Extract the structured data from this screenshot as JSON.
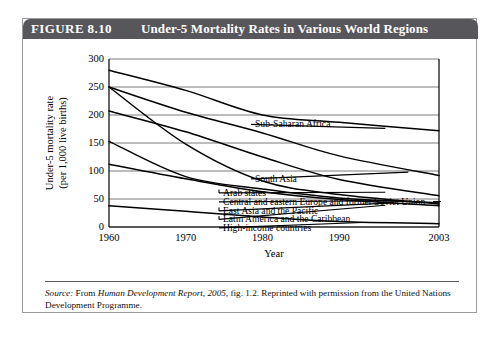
{
  "figure": {
    "number_label": "FIGURE 8.10",
    "title": "Under-5 Mortality Rates in Various World Regions"
  },
  "source_note": {
    "label": "Source:",
    "text_1": " From ",
    "publication": "Human Development Report, 2005,",
    "text_2": " fig. 1.2. Reprinted with permission from the United Nations Development Programme."
  },
  "chart_data": {
    "type": "line",
    "title": "",
    "xlabel": "Year",
    "ylabel": "Under-5 mortality rate\n(per 1,000 live births)",
    "ylabel_line1": "Under-5 mortality rate",
    "ylabel_line2": "(per 1,000 live births)",
    "x": [
      1960,
      1970,
      1980,
      1990,
      2003
    ],
    "xticks": [
      "1960",
      "1970",
      "1980",
      "1990",
      "2003"
    ],
    "yticks": [
      "0",
      "50",
      "100",
      "150",
      "200",
      "250",
      "300"
    ],
    "ylim": [
      0,
      300
    ],
    "xlim": [
      1960,
      2003
    ],
    "grid": "horizontal",
    "legend": "inline-leader-labels",
    "series": [
      {
        "name": "Sub-Saharan Africa",
        "values": [
          280,
          244,
          200,
          187,
          172
        ]
      },
      {
        "name": "South Asia",
        "values": [
          250,
          205,
          168,
          127,
          92
        ]
      },
      {
        "name": "Arab states",
        "values": [
          207,
          170,
          125,
          85,
          56
        ]
      },
      {
        "name": "Central and eastern Europe and former Soviet Union",
        "values": [
          153,
          90,
          68,
          52,
          43
        ]
      },
      {
        "name": "East Asia and the Pacific",
        "values": [
          250,
          148,
          82,
          58,
          41
        ]
      },
      {
        "name": "Latin America and the Caribbean",
        "values": [
          112,
          86,
          63,
          49,
          38
        ]
      },
      {
        "name": "High-income countries",
        "values": [
          38,
          28,
          18,
          10,
          6
        ]
      }
    ],
    "labels_right": [
      "Sub-Saharan Africa",
      "South Asia",
      "Arab states",
      "Central and eastern Europe and former Soviet Union",
      "East Asia and the Pacific",
      "Latin America and the Caribbean",
      "High-income countries"
    ],
    "colors": {
      "line": "#000000",
      "grid": "#6b6b6b",
      "axis": "#000000"
    }
  }
}
